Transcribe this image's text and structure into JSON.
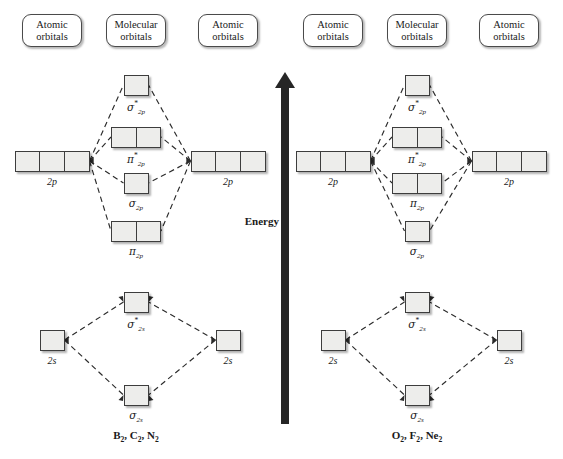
{
  "headers": {
    "atomic": {
      "line1": "Atomic",
      "line2": "orbitals"
    },
    "molecular": {
      "line1": "Molecular",
      "line2": "orbitals"
    }
  },
  "energy_axis": {
    "label": "Energy",
    "icon": "up-arrow-icon",
    "direction": "up"
  },
  "diagrams": [
    {
      "id": "left",
      "formula": "B₂, C₂, N₂",
      "formula_parts": [
        {
          "el": "B",
          "sub": "2"
        },
        {
          "el": "C",
          "sub": "2"
        },
        {
          "el": "N",
          "sub": "2"
        }
      ],
      "atomic_left": [
        {
          "label": "2p",
          "boxes": 3
        },
        {
          "label": "2s",
          "boxes": 1
        }
      ],
      "atomic_right": [
        {
          "label": "2p",
          "boxes": 3
        },
        {
          "label": "2s",
          "boxes": 1
        }
      ],
      "molecular": [
        {
          "symbol": "σ",
          "star": true,
          "sub": "2p",
          "boxes": 1,
          "label": "sigma-star-2p"
        },
        {
          "symbol": "π",
          "star": true,
          "sub": "2p",
          "boxes": 2,
          "label": "pi-star-2p"
        },
        {
          "symbol": "σ",
          "star": false,
          "sub": "2p",
          "boxes": 1,
          "label": "sigma-2p"
        },
        {
          "symbol": "π",
          "star": false,
          "sub": "2p",
          "boxes": 2,
          "label": "pi-2p"
        },
        {
          "symbol": "σ",
          "star": true,
          "sub": "2s",
          "boxes": 1,
          "label": "sigma-star-2s"
        },
        {
          "symbol": "σ",
          "star": false,
          "sub": "2s",
          "boxes": 1,
          "label": "sigma-2s"
        }
      ]
    },
    {
      "id": "right",
      "formula": "O₂, F₂, Ne₂",
      "formula_parts": [
        {
          "el": "O",
          "sub": "2"
        },
        {
          "el": "F",
          "sub": "2"
        },
        {
          "el": "Ne",
          "sub": "2"
        }
      ],
      "atomic_left": [
        {
          "label": "2p",
          "boxes": 3
        },
        {
          "label": "2s",
          "boxes": 1
        }
      ],
      "atomic_right": [
        {
          "label": "2p",
          "boxes": 3
        },
        {
          "label": "2s",
          "boxes": 1
        }
      ],
      "molecular": [
        {
          "symbol": "σ",
          "star": true,
          "sub": "2p",
          "boxes": 1,
          "label": "sigma-star-2p"
        },
        {
          "symbol": "π",
          "star": true,
          "sub": "2p",
          "boxes": 2,
          "label": "pi-star-2p"
        },
        {
          "symbol": "π",
          "star": false,
          "sub": "2p",
          "boxes": 2,
          "label": "pi-2p"
        },
        {
          "symbol": "σ",
          "star": false,
          "sub": "2p",
          "boxes": 1,
          "label": "sigma-2p"
        },
        {
          "symbol": "σ",
          "star": true,
          "sub": "2s",
          "boxes": 1,
          "label": "sigma-star-2s"
        },
        {
          "symbol": "σ",
          "star": false,
          "sub": "2s",
          "boxes": 1,
          "label": "sigma-2s"
        }
      ]
    }
  ],
  "colors": {
    "box_fill": "#ededeb",
    "box_border": "#3d3d3d",
    "line": "#2b2b2b",
    "arrow": "#262626",
    "text": "#1a1a1a",
    "background": "#ffffff"
  }
}
